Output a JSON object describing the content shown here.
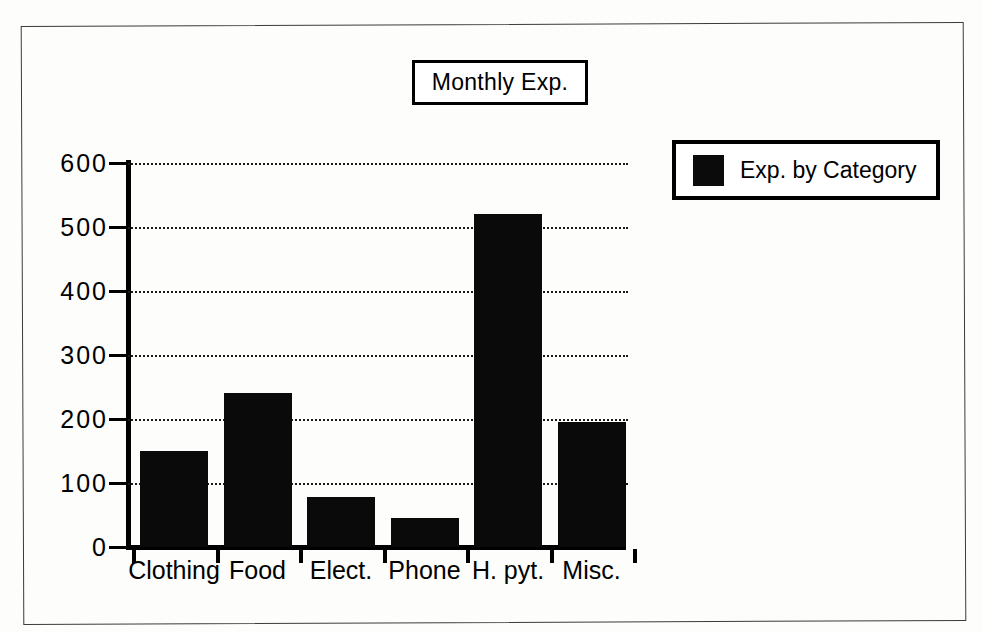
{
  "chart_data": {
    "type": "bar",
    "title": "Monthly Exp.",
    "xlabel": "",
    "ylabel": "",
    "categories": [
      "Clothing",
      "Food",
      "Elect.",
      "Phone",
      "H. pyt.",
      "Misc."
    ],
    "values": [
      150,
      240,
      78,
      45,
      520,
      195
    ],
    "series": [
      {
        "name": "Exp. by Category",
        "color": "#0a0a0a",
        "values": [
          150,
          240,
          78,
          45,
          520,
          195
        ]
      }
    ],
    "ylim": [
      0,
      600
    ],
    "yticks": [
      0,
      100,
      200,
      300,
      400,
      500,
      600
    ],
    "ytick_labels": [
      "0",
      "100",
      "200",
      "300",
      "400",
      "500",
      "600"
    ],
    "grid": true,
    "grid_style": "dotted-horizontal",
    "legend": {
      "position": "top-right-outside",
      "entries": [
        {
          "label": "Exp. by Category",
          "color": "#0a0a0a",
          "swatch": "filled-square"
        }
      ]
    },
    "bar_color": "#0a0a0a",
    "background": "#ffffff"
  },
  "title_box": {
    "label": "Monthly Exp."
  },
  "legend_box": {
    "swatch_name": "legend-color-swatch",
    "label": "Exp. by Category"
  },
  "axes": {
    "y_tick_labels": [
      "600",
      "500",
      "400",
      "300",
      "200",
      "100",
      "0"
    ],
    "x_tick_labels": [
      "Clothing",
      "Food",
      "Elect.",
      "Phone",
      "H. pyt.",
      "Misc."
    ]
  }
}
